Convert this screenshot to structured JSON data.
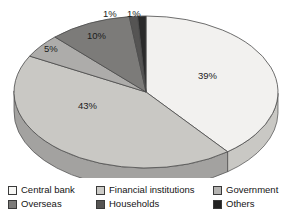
{
  "chart_data": {
    "type": "pie",
    "title": "",
    "subtitle": "",
    "xlabel": "",
    "ylabel": "",
    "grid": false,
    "three_d": true,
    "legend_position": "bottom",
    "legend_columns": 3,
    "legend_rows": 2,
    "value_suffix": "%",
    "categories": [
      "Central bank",
      "Financial institutions",
      "Government",
      "Overseas",
      "Households",
      "Others"
    ],
    "values": [
      39,
      43,
      5,
      10,
      1,
      1
    ],
    "labels": [
      "39%",
      "43%",
      "5%",
      "10%",
      "1%",
      "1%"
    ],
    "colors": [
      "#f2f1ef",
      "#c9c8c4",
      "#adacaa",
      "#7c7b79",
      "#555453",
      "#2a2a2a"
    ],
    "side_colors": [
      "#c9c8c4",
      "#a3a2a0",
      "#8d8c8a",
      "#646362",
      "#444342",
      "#1f1f1f"
    ],
    "slices": [
      {
        "name": "Central bank",
        "value": 39,
        "label": "39%",
        "color": "#f2f1ef"
      },
      {
        "name": "Financial institutions",
        "value": 43,
        "label": "43%",
        "color": "#c9c8c4"
      },
      {
        "name": "Government",
        "value": 5,
        "label": "5%",
        "color": "#adacaa"
      },
      {
        "name": "Overseas",
        "value": 10,
        "label": "10%",
        "color": "#7c7b79"
      },
      {
        "name": "Households",
        "value": 1,
        "label": "1%",
        "color": "#555453"
      },
      {
        "name": "Others",
        "value": 1,
        "label": "1%",
        "color": "#2a2a2a"
      }
    ]
  },
  "legend": {
    "rows": [
      [
        {
          "label": "Central bank",
          "color": "#f7f7f5"
        },
        {
          "label": "Financial institutions",
          "color": "#cccbc7"
        },
        {
          "label": "Government",
          "color": "#b4b3b1"
        }
      ],
      [
        {
          "label": "Overseas",
          "color": "#7c7b79"
        },
        {
          "label": "Households",
          "color": "#555453"
        },
        {
          "label": "Others",
          "color": "#222222"
        }
      ]
    ]
  },
  "slice_labels": {
    "central_bank": "39%",
    "financial_institutions": "43%",
    "government": "5%",
    "overseas": "10%",
    "households": "1%",
    "others": "1%"
  }
}
